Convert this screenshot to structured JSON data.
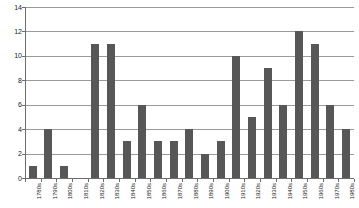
{
  "chart_data": {
    "type": "bar",
    "title": "",
    "subtitle": "",
    "xlabel": "",
    "ylabel": "",
    "ylim": [
      0,
      14
    ],
    "ytick_values": [
      0,
      2,
      4,
      6,
      8,
      10,
      12,
      14
    ],
    "ytick_labels": [
      "0",
      "2",
      "4",
      "6",
      "8",
      "10",
      "12",
      "14"
    ],
    "grid": true,
    "legend": null,
    "bar_color": "#575757",
    "gridline_color": "#9a9a9a",
    "axis_color": "#6d6d6d",
    "background_color": "#ffffff",
    "categories": [
      "1780s",
      "1790s",
      "1800s",
      "1810s",
      "1820s",
      "1830s",
      "1840s",
      "1850s",
      "1860s",
      "1870s",
      "1880s",
      "1890s",
      "1900s",
      "1910s",
      "1920s",
      "1930s",
      "1940s",
      "1950s",
      "1960s",
      "1970s",
      "1980s"
    ],
    "values": [
      1,
      4,
      1,
      0,
      11,
      11,
      3,
      6,
      3,
      3,
      4,
      2,
      3,
      10,
      5,
      9,
      6,
      12,
      11,
      6,
      4
    ]
  }
}
